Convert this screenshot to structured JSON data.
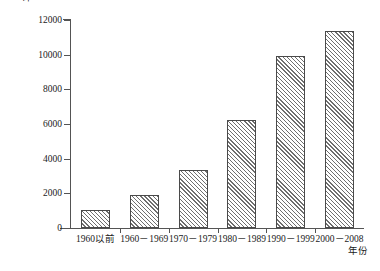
{
  "chart_data": {
    "type": "bar",
    "title": "",
    "subtitle": "",
    "xlabel": "年份",
    "ylabel": "平均单产/(kg/hm2)",
    "ylabel_main": "平均单产/(kg/hm",
    "ylabel_sup": "2",
    "ylabel_tail": ")",
    "categories": [
      "1960以前",
      "1960－1969",
      "1970－1979",
      "1980－1989",
      "1990－1999",
      "2000－2008"
    ],
    "values": [
      1050,
      1880,
      3340,
      6230,
      9950,
      11350
    ],
    "series": [
      {
        "name": "平均单产",
        "values": [
          1050,
          1880,
          3340,
          6230,
          9950,
          11350
        ]
      }
    ],
    "ylim": [
      0,
      12000
    ],
    "ytick_values": [
      0,
      2000,
      4000,
      6000,
      8000,
      10000,
      12000
    ],
    "ytick_labels": [
      "0",
      "2000",
      "4000",
      "6000",
      "8000",
      "10000",
      "12000"
    ],
    "grid": false,
    "legend": null,
    "legend_position": "none",
    "bar_fill": "hatched-diagonal",
    "bar_edge_color": "#4a4a4a",
    "axis_color": "#545454",
    "background_color": "#ffffff"
  }
}
